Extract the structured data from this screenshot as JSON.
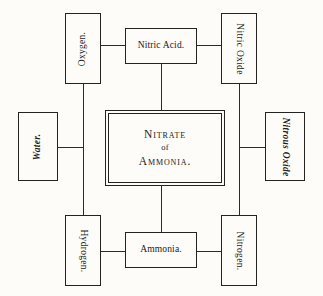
{
  "diagram": {
    "background_color": "#fdfcf8",
    "ink_color": "#232323",
    "center": {
      "line1": "Nitrate",
      "line2": "of",
      "line3": "Ammonia."
    },
    "nodes": {
      "oxygen": "Oxygen.",
      "nitric_acid": "Nitric Acid.",
      "nitric_oxide": "Nitric Oxide",
      "water": "Water.",
      "nitrous_oxide": "Nitrous Oxide",
      "hydrogen": "Hydrogen.",
      "ammonia": "Ammonia.",
      "nitrogen": "Nitrogen."
    }
  }
}
